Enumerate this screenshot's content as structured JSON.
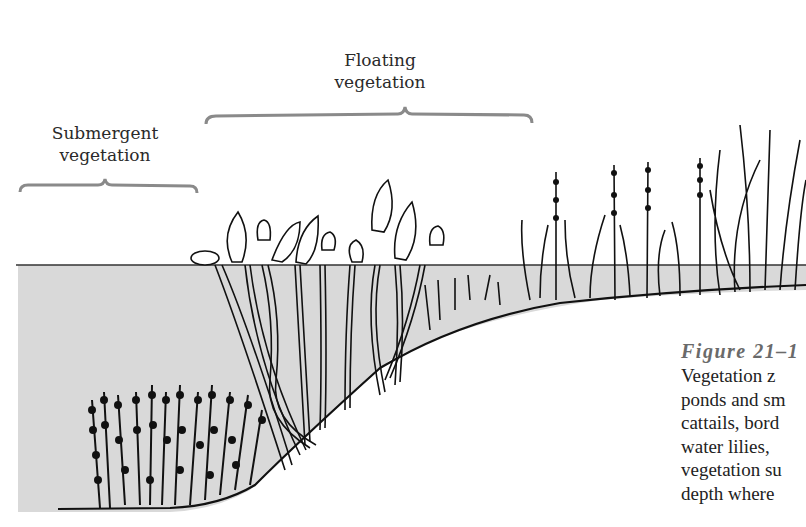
{
  "zones": [
    {
      "id": "floating",
      "label_lines": [
        "Floating",
        "vegetation"
      ]
    },
    {
      "id": "submergent",
      "label_lines": [
        "Submergent",
        "vegetation"
      ]
    }
  ],
  "caption": {
    "figure_label": "Figure 21–1",
    "lines": [
      "Vegetation z",
      "ponds and sm",
      "cattails, bord",
      "water lilies, ",
      "vegetation su",
      "depth where"
    ]
  },
  "colors": {
    "ink": "#1a1a1a",
    "water": "#d9d9d9",
    "brace": "#8a8a8a",
    "figure_label": "#6a6a6a"
  }
}
